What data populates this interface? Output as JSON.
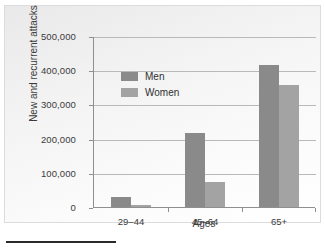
{
  "chart_data": {
    "type": "bar",
    "title": "",
    "subtitle": "",
    "xlabel": "Ages",
    "ylabel": "New and recurrent attacks",
    "categories": [
      "29–44",
      "45–64",
      "65+"
    ],
    "series": [
      {
        "name": "Men",
        "values": [
          29000,
          215000,
          415000
        ],
        "color": "#8a8a8a"
      },
      {
        "name": "Women",
        "values": [
          7000,
          72000,
          357000
        ],
        "color": "#a3a3a3"
      }
    ],
    "ylim": [
      0,
      500000
    ],
    "yticks": [
      0,
      100000,
      200000,
      300000,
      400000,
      500000
    ],
    "ytick_labels": [
      "0",
      "100,000",
      "200,000",
      "300,000",
      "400,000",
      "500,000"
    ],
    "grid": true,
    "legend_position": "upper left"
  },
  "axes": {
    "y_title": "New and recurrent attacks",
    "x_title": "Ages"
  },
  "legend": {
    "entries": [
      {
        "label": "Men"
      },
      {
        "label": "Women"
      }
    ]
  }
}
